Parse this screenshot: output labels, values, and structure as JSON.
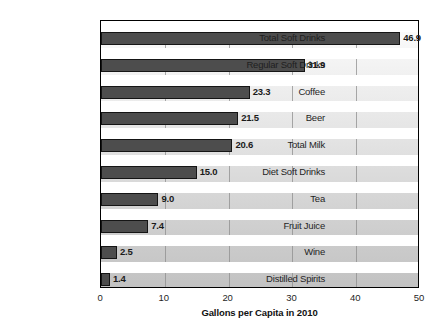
{
  "chart_data": {
    "type": "bar",
    "orientation": "horizontal",
    "title": "",
    "xlabel": "Gallons per Capita in 2010",
    "ylabel": "",
    "xlim": [
      0,
      50
    ],
    "xticks": [
      "0",
      "10",
      "20",
      "30",
      "40",
      "50"
    ],
    "grid": "vertical",
    "legend": "none",
    "categories": [
      "Total Soft Drinks",
      "Regular Soft Drinks",
      "Coffee",
      "Beer",
      "Total Milk",
      "Diet Soft Drinks",
      "Tea",
      "Fruit Juice",
      "Wine",
      "Distilled Spirits"
    ],
    "values": [
      46.9,
      31.9,
      23.3,
      21.5,
      20.6,
      15.0,
      9.0,
      7.4,
      2.5,
      1.4
    ],
    "value_labels": [
      "46.9",
      "31.9",
      "23.3",
      "21.5",
      "20.6",
      "15.0",
      "9.0",
      "7.4",
      "2.5",
      "1.4"
    ],
    "colors": {
      "bar_fill": "#4d4d4d",
      "bar_border": "#151515",
      "plot_background_top": "#fdfdfd",
      "plot_background_bottom": "#c2c2c2",
      "gridline": "#8e8e8e",
      "frame": "#000000",
      "text": "#1f1f1f"
    }
  }
}
